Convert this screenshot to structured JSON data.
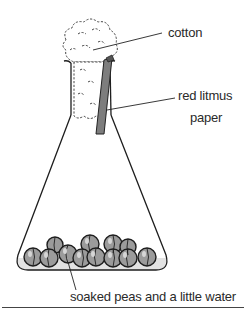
{
  "diagram": {
    "labels": {
      "cotton": "cotton",
      "litmus_line1": "red litmus",
      "litmus_line2": "paper",
      "peas": "soaked peas and a little water"
    },
    "colors": {
      "outline": "#1e1e1e",
      "litmus": "#7a7a7a",
      "pea_fill": "#9a9a9a",
      "water": "#d8d8d8",
      "text": "#2a2a2a"
    }
  }
}
